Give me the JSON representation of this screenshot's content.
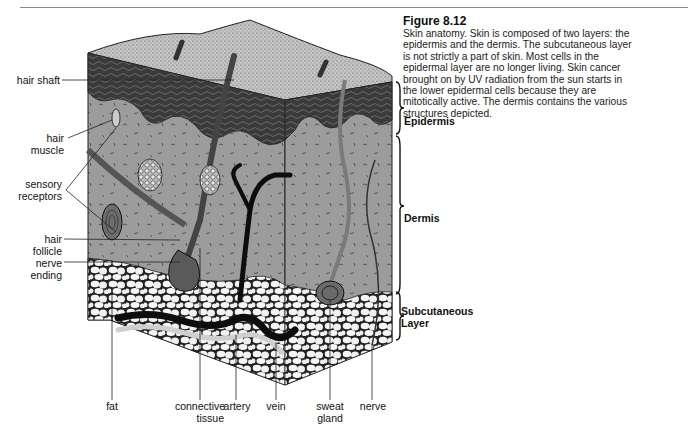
{
  "figure": {
    "title": "Figure 8.12",
    "caption_lines": [
      "Skin anatomy. Skin is composed of two layers: the",
      "epidermis and the dermis. The subcutaneous layer",
      "is not strictly a part of skin. Most cells in the",
      "epidermal layer are no longer living. Skin cancer",
      "brought on by UV radiation from the sun starts in",
      "the lower epidermal cells because they are",
      "mitotically active. The dermis contains the various",
      "structures depicted."
    ]
  },
  "left_labels": {
    "hair_shaft": "hair shaft",
    "hair_muscle_1": "hair",
    "hair_muscle_2": "muscle",
    "sensory_1": "sensory",
    "sensory_2": "receptors",
    "hair_follicle_1": "hair",
    "hair_follicle_2": "follicle",
    "nerve_ending_1": "nerve",
    "nerve_ending_2": "ending"
  },
  "bottom_labels": {
    "fat": "fat",
    "connective_1": "connective",
    "connective_2": "tissue",
    "artery": "artery",
    "vein": "vein",
    "sweat_1": "sweat",
    "sweat_2": "gland",
    "nerve": "nerve"
  },
  "layer_labels": {
    "epidermis": "Epidermis",
    "dermis": "Dermis",
    "subcutaneous_1": "Subcutaneous",
    "subcutaneous_2": "Layer"
  },
  "colors": {
    "surface": "#b8b8b8",
    "epidermis": "#4a4a4a",
    "dermis": "#9a9a9a",
    "fat": "#f2f2f2",
    "vessel_dark": "#0d0d0d",
    "vessel_light": "#d8d8d8"
  }
}
